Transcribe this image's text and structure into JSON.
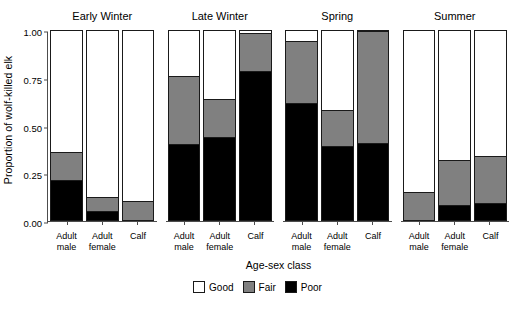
{
  "chart_data": {
    "type": "bar",
    "subtype": "stacked-proportional",
    "title": "",
    "xlabel": "Age-sex class",
    "ylabel": "Proportion of wolf-killed elk",
    "ylim": [
      0,
      1
    ],
    "yticks": [
      "0.00",
      "0.25",
      "0.50",
      "0.75",
      "1.00"
    ],
    "ytick_values": [
      0,
      0.25,
      0.5,
      0.75,
      1.0
    ],
    "grid": false,
    "legend_position": "bottom",
    "categories": [
      "Adult male",
      "Adult female",
      "Calf"
    ],
    "legend": [
      {
        "name": "Good",
        "color": "#ffffff"
      },
      {
        "name": "Fair",
        "color": "#808080"
      },
      {
        "name": "Poor",
        "color": "#000000"
      }
    ],
    "facets": [
      {
        "name": "Early Winter",
        "bars": [
          {
            "category": "Adult male",
            "poor": 0.21,
            "fair": 0.15,
            "good": 0.64
          },
          {
            "category": "Adult female",
            "poor": 0.05,
            "fair": 0.07,
            "good": 0.88
          },
          {
            "category": "Calf",
            "poor": 0.0,
            "fair": 0.1,
            "good": 0.9
          }
        ]
      },
      {
        "name": "Late Winter",
        "bars": [
          {
            "category": "Adult male",
            "poor": 0.4,
            "fair": 0.36,
            "good": 0.24
          },
          {
            "category": "Adult female",
            "poor": 0.44,
            "fair": 0.2,
            "good": 0.36
          },
          {
            "category": "Calf",
            "poor": 0.79,
            "fair": 0.2,
            "good": 0.01
          }
        ]
      },
      {
        "name": "Spring",
        "bars": [
          {
            "category": "Adult male",
            "poor": 0.62,
            "fair": 0.33,
            "good": 0.05
          },
          {
            "category": "Adult female",
            "poor": 0.39,
            "fair": 0.19,
            "good": 0.42
          },
          {
            "category": "Calf",
            "poor": 0.41,
            "fair": 0.59,
            "good": 0.0
          }
        ]
      },
      {
        "name": "Summer",
        "bars": [
          {
            "category": "Adult male",
            "poor": 0.0,
            "fair": 0.15,
            "good": 0.85
          },
          {
            "category": "Adult female",
            "poor": 0.08,
            "fair": 0.24,
            "good": 0.68
          },
          {
            "category": "Calf",
            "poor": 0.09,
            "fair": 0.25,
            "good": 0.66
          }
        ]
      }
    ]
  }
}
